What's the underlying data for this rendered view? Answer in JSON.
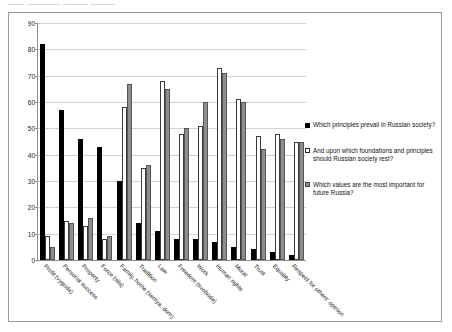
{
  "page_header": "——   ————  ——— ———",
  "chart_data": {
    "type": "bar",
    "title": "",
    "xlabel": "",
    "ylabel": "",
    "ylim": [
      0,
      90
    ],
    "yticks": [
      0,
      10,
      20,
      30,
      40,
      50,
      60,
      70,
      80,
      90
    ],
    "grid": true,
    "legend_position": "right",
    "categories": [
      "Profit (vygoda)",
      "Personal success",
      "Property",
      "Force (sila)",
      "Family, home (semya, dom)",
      "Tradition",
      "Law",
      "Freedom (svoboda)",
      "Work",
      "Human rights",
      "Moral",
      "Trust",
      "Equality",
      "Respect for others' opinion"
    ],
    "series": [
      {
        "name": "Which principles prevail in Russian society?",
        "color": "#000000",
        "values": [
          82,
          57,
          46,
          43,
          30,
          14,
          11,
          8,
          8,
          7,
          5,
          4,
          3,
          2
        ]
      },
      {
        "name": "And upon which foundations and principles should Russian society rest?",
        "color": "#ffffff",
        "values": [
          9,
          15,
          13,
          8,
          58,
          35,
          68,
          48,
          51,
          73,
          61,
          47,
          48,
          45
        ]
      },
      {
        "name": "Which values are the most important for future Russia?",
        "color": "#8e8e8e",
        "values": [
          5,
          14,
          16,
          9,
          67,
          36,
          65,
          50,
          60,
          71,
          60,
          42,
          46,
          45
        ]
      }
    ]
  },
  "legend": {
    "items": [
      {
        "label": "Which principles prevail in Russian society?"
      },
      {
        "label": "And upon which foundations and principles should Russian society rest?"
      },
      {
        "label": "Which values are the most important for future Russia?"
      }
    ]
  }
}
